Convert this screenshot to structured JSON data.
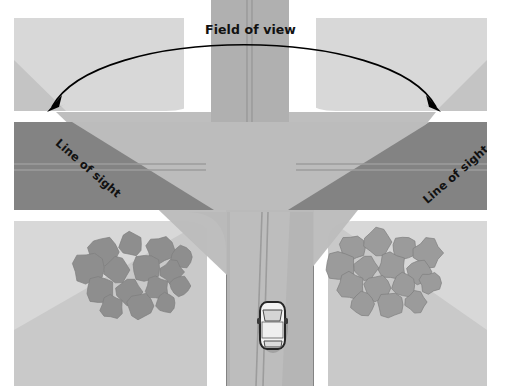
{
  "figure": {
    "type": "diagram",
    "labels": {
      "field_of_view": "Field of view",
      "line_of_sight_left": "Line of sight",
      "line_of_sight_right": "Line of sight"
    },
    "caption_fragment": {
      "line1": "◄",
      "line2": "T",
      "line3": "i",
      "line4": "h",
      "line5": "t",
      "line6": "s"
    },
    "colors": {
      "page_background": "#ffffff",
      "grass_light": "#d8d8d8",
      "grass_shadow": "#c2c2c2",
      "road_dark": "#838383",
      "road_cone_light": "#bcbcbc",
      "road_cone_mid": "#b3b3b3",
      "curb_white": "#ffffff",
      "lane_marking": "#9a9a9a",
      "tree_canopy": "#8e8e8e",
      "tree_canopy_right": "#9b9b9b",
      "car_body": "#f2f2f2",
      "car_outline": "#2b2b2b",
      "arrow_stroke": "#000000",
      "text": "#111111",
      "gutter_rule": "#6f6f6f"
    },
    "elements": {
      "horizontal_road": {
        "x": 14,
        "y": 122,
        "width": 473,
        "height": 88
      },
      "vertical_road_top": {
        "x": 210,
        "y": 0,
        "width": 80,
        "height": 122
      },
      "vertical_road_bottom": {
        "x": 228,
        "y": 210,
        "width": 84,
        "height": 176
      },
      "quadrant_top_left": {
        "x": 14,
        "y": 18,
        "width": 168,
        "height": 92
      },
      "quadrant_top_right": {
        "x": 318,
        "y": 18,
        "width": 169,
        "height": 92
      },
      "quadrant_bottom_left": {
        "x": 14,
        "y": 222,
        "width": 190,
        "height": 164
      },
      "quadrant_bottom_right": {
        "x": 330,
        "y": 222,
        "width": 157,
        "height": 164
      },
      "car": {
        "x": 259,
        "y": 301,
        "width": 26,
        "height": 49,
        "heading": "north"
      },
      "arrow": {
        "style": "double-headed-arc",
        "from": [
          48,
          104
        ],
        "to": [
          462,
          104
        ],
        "apex_y": 30
      }
    },
    "tree_clusters": {
      "left": {
        "count": 15,
        "positions": [
          [
            103,
            252,
            15
          ],
          [
            131,
            244,
            12
          ],
          [
            160,
            250,
            14
          ],
          [
            182,
            257,
            11
          ],
          [
            88,
            268,
            16
          ],
          [
            117,
            270,
            13
          ],
          [
            146,
            268,
            14
          ],
          [
            172,
            272,
            12
          ],
          [
            100,
            290,
            14
          ],
          [
            129,
            292,
            13
          ],
          [
            157,
            288,
            12
          ],
          [
            180,
            286,
            10
          ],
          [
            112,
            307,
            12
          ],
          [
            140,
            306,
            13
          ],
          [
            166,
            303,
            10
          ]
        ]
      },
      "right": {
        "count": 15,
        "positions": [
          [
            352,
            248,
            13
          ],
          [
            378,
            242,
            14
          ],
          [
            404,
            248,
            12
          ],
          [
            428,
            253,
            15
          ],
          [
            340,
            266,
            15
          ],
          [
            366,
            268,
            12
          ],
          [
            392,
            266,
            14
          ],
          [
            419,
            272,
            12
          ],
          [
            351,
            286,
            14
          ],
          [
            377,
            288,
            13
          ],
          [
            404,
            285,
            12
          ],
          [
            430,
            283,
            11
          ],
          [
            363,
            304,
            12
          ],
          [
            390,
            305,
            13
          ],
          [
            416,
            302,
            11
          ]
        ]
      }
    }
  }
}
